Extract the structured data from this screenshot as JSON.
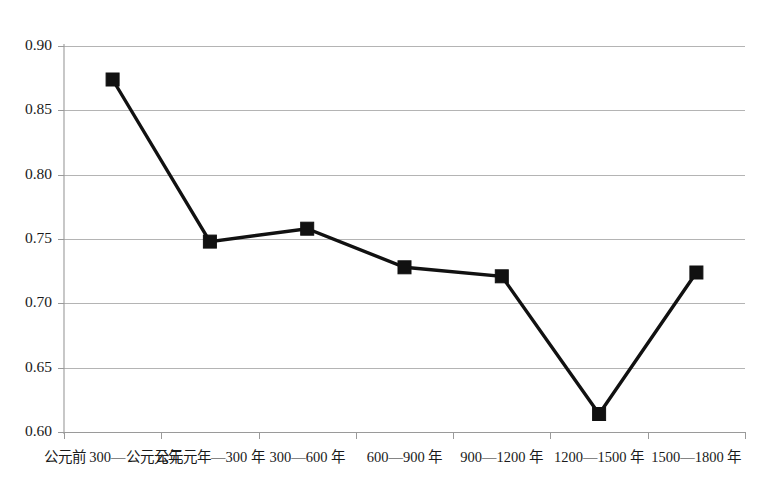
{
  "chart_data": {
    "type": "line",
    "title": "",
    "subtitle": "",
    "xlabel": "",
    "ylabel": "",
    "categories": [
      "公元前 300—公元元年",
      "公元元年—300 年",
      "300—600 年",
      "600—900 年",
      "900—1200 年",
      "1200—1500 年",
      "1500—1800 年"
    ],
    "values": [
      0.874,
      0.748,
      0.758,
      0.728,
      0.721,
      0.614,
      0.724
    ],
    "series": [
      {
        "name": "",
        "values": [
          0.874,
          0.748,
          0.758,
          0.728,
          0.721,
          0.614,
          0.724
        ]
      }
    ],
    "ylim": [
      0.6,
      0.9
    ],
    "ytick_labels": [
      "0.90",
      "0.85",
      "0.80",
      "0.75",
      "0.70",
      "0.65",
      "0.60"
    ],
    "ytick_values": [
      0.9,
      0.85,
      0.8,
      0.75,
      0.7,
      0.65,
      0.6
    ],
    "grid": "horizontal",
    "legend": "none",
    "marker": "square",
    "colors": {
      "line": "#111111",
      "marker": "#111111",
      "grid": "#b4b4b4",
      "axis": "#9a9a9a",
      "background": "#ffffff"
    }
  }
}
